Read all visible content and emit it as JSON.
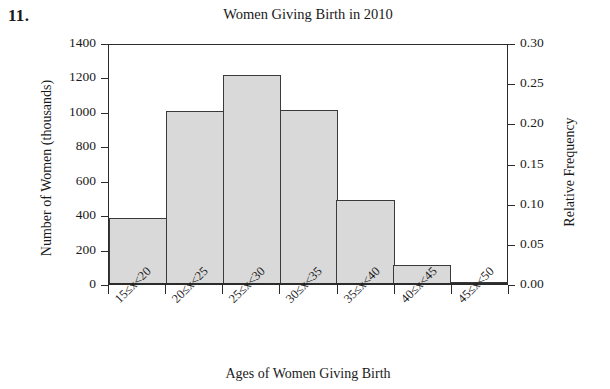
{
  "problem_number": "11.",
  "chart_data": {
    "type": "bar",
    "title": "Women Giving Birth in 2010",
    "xlabel": "Ages of Women Giving Birth",
    "ylabel": "Number of Women (thousands)",
    "y2label": "Relative Frequency",
    "categories": [
      "15≤x<20",
      "20≤x<25",
      "25≤x<30",
      "30≤x<35",
      "35≤x<40",
      "40≤x<45",
      "45≤x<50"
    ],
    "values": [
      375,
      1000,
      1210,
      1005,
      480,
      105,
      5
    ],
    "relative_frequency": [
      0.08,
      0.215,
      0.26,
      0.215,
      0.103,
      0.023,
      0.001
    ],
    "ylim": [
      0,
      1400
    ],
    "y2lim": [
      0.0,
      0.3
    ],
    "yticks": [
      0,
      200,
      400,
      600,
      800,
      1000,
      1200,
      1400
    ],
    "ytick_labels": [
      "0",
      "200",
      "400",
      "600",
      "800",
      "1000",
      "1200",
      "1400"
    ],
    "y2ticks": [
      0.0,
      0.05,
      0.1,
      0.15,
      0.2,
      0.25,
      0.3
    ],
    "y2tick_labels": [
      "0.00",
      "0.05",
      "0.10",
      "0.15",
      "0.20",
      "0.25",
      "0.30"
    ],
    "grid": false,
    "legend": false,
    "bar_fill_color": "#d9d9d9",
    "bar_edge_color": "#3a3a3a",
    "axis_color": "#2b2b2b",
    "background_color": "#ffffff"
  }
}
